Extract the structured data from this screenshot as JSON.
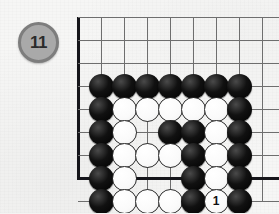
{
  "diagram": {
    "move_number_label": "11",
    "badge_fill": "#a9a9a9",
    "badge_border": "#7d7d7d",
    "background": "#f6f6f5",
    "grid_color": "#6e6e6e",
    "edge_color": "#15151a"
  },
  "board": {
    "columns": 9,
    "rows": 8,
    "cell": 23,
    "left_edge_col": 0,
    "bottom_edge_row": 7,
    "hoshi": [
      {
        "col": 3,
        "row": 4
      }
    ],
    "stones": [
      {
        "col": 1,
        "row": 3,
        "color": "black",
        "label": ""
      },
      {
        "col": 2,
        "row": 3,
        "color": "black",
        "label": ""
      },
      {
        "col": 3,
        "row": 3,
        "color": "black",
        "label": ""
      },
      {
        "col": 4,
        "row": 3,
        "color": "black",
        "label": ""
      },
      {
        "col": 5,
        "row": 3,
        "color": "black",
        "label": ""
      },
      {
        "col": 6,
        "row": 3,
        "color": "black",
        "label": ""
      },
      {
        "col": 7,
        "row": 3,
        "color": "black",
        "label": ""
      },
      {
        "col": 1,
        "row": 4,
        "color": "black",
        "label": ""
      },
      {
        "col": 2,
        "row": 4,
        "color": "white",
        "label": ""
      },
      {
        "col": 3,
        "row": 4,
        "color": "white",
        "label": ""
      },
      {
        "col": 4,
        "row": 4,
        "color": "white",
        "label": ""
      },
      {
        "col": 5,
        "row": 4,
        "color": "white",
        "label": ""
      },
      {
        "col": 6,
        "row": 4,
        "color": "white",
        "label": ""
      },
      {
        "col": 7,
        "row": 4,
        "color": "black",
        "label": ""
      },
      {
        "col": 1,
        "row": 5,
        "color": "black",
        "label": ""
      },
      {
        "col": 2,
        "row": 5,
        "color": "white",
        "label": ""
      },
      {
        "col": 4,
        "row": 5,
        "color": "black",
        "label": ""
      },
      {
        "col": 5,
        "row": 5,
        "color": "black",
        "label": ""
      },
      {
        "col": 6,
        "row": 5,
        "color": "white",
        "label": ""
      },
      {
        "col": 7,
        "row": 5,
        "color": "black",
        "label": ""
      },
      {
        "col": 1,
        "row": 6,
        "color": "black",
        "label": ""
      },
      {
        "col": 2,
        "row": 6,
        "color": "white",
        "label": ""
      },
      {
        "col": 3,
        "row": 6,
        "color": "white",
        "label": ""
      },
      {
        "col": 4,
        "row": 6,
        "color": "white",
        "label": ""
      },
      {
        "col": 5,
        "row": 6,
        "color": "black",
        "label": ""
      },
      {
        "col": 6,
        "row": 6,
        "color": "white",
        "label": ""
      },
      {
        "col": 7,
        "row": 6,
        "color": "black",
        "label": ""
      },
      {
        "col": 1,
        "row": 7,
        "color": "black",
        "label": ""
      },
      {
        "col": 2,
        "row": 7,
        "color": "white",
        "label": ""
      },
      {
        "col": 5,
        "row": 7,
        "color": "black",
        "label": ""
      },
      {
        "col": 6,
        "row": 7,
        "color": "white",
        "label": ""
      },
      {
        "col": 7,
        "row": 7,
        "color": "black",
        "label": ""
      },
      {
        "col": 1,
        "row": 8,
        "color": "black",
        "label": ""
      },
      {
        "col": 2,
        "row": 8,
        "color": "white",
        "label": ""
      },
      {
        "col": 3,
        "row": 8,
        "color": "white",
        "label": ""
      },
      {
        "col": 4,
        "row": 8,
        "color": "white",
        "label": ""
      },
      {
        "col": 5,
        "row": 8,
        "color": "black",
        "label": ""
      },
      {
        "col": 6,
        "row": 8,
        "color": "white",
        "label": "1"
      },
      {
        "col": 7,
        "row": 8,
        "color": "black",
        "label": ""
      }
    ]
  }
}
